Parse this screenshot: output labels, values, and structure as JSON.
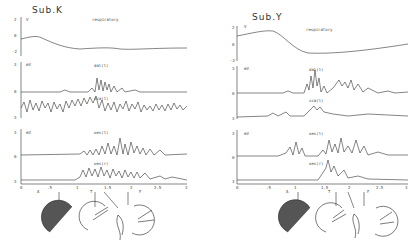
{
  "panels": [
    {
      "title": "Sub.K",
      "resp": {
        "label": "respiratory",
        "unit": "V",
        "ticks": [
          "2",
          "0",
          "-2"
        ]
      },
      "emg_top": {
        "unit": "mV",
        "ticks": [
          "3",
          "0",
          "3"
        ],
        "channels": [
          "dal(l)",
          "sca(l)"
        ]
      },
      "emg_bottom": {
        "unit": "mV",
        "ticks": [
          "3",
          "0",
          "3"
        ],
        "channels": [
          "oes(l)",
          "oes(r)"
        ]
      },
      "x_axis": {
        "ticks": [
          "0",
          ".5",
          "1",
          "1.5",
          "2",
          "2.5",
          "3"
        ],
        "unit": "sec",
        "markers": [
          "A",
          "T",
          "F"
        ]
      },
      "figures": [
        "posture-1",
        "posture-2",
        "posture-3",
        "posture-4"
      ]
    },
    {
      "title": "Sub.Y",
      "resp": {
        "label": "respiratory",
        "unit": "V",
        "ticks": [
          "2",
          "0",
          "-2"
        ]
      },
      "emg_top": {
        "unit": "mV",
        "ticks": [
          "3",
          "0",
          "3"
        ],
        "channels": [
          "dal(l)",
          "sca(l)"
        ]
      },
      "emg_bottom": {
        "unit": "mV",
        "ticks": [
          "3",
          "0",
          "3"
        ],
        "channels": [
          "oes(l)",
          "oes(r)"
        ]
      },
      "x_axis": {
        "ticks": [
          "0",
          ".5",
          "1",
          "1.5",
          "2",
          "2.5",
          "3"
        ],
        "unit": "sec",
        "markers": [
          "A",
          "T",
          "F"
        ]
      },
      "figures": [
        "posture-1",
        "posture-2",
        "posture-3",
        "posture-4"
      ]
    }
  ]
}
